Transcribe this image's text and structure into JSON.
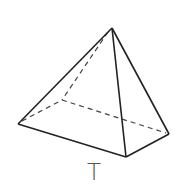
{
  "diagram": {
    "type": "pyramid",
    "label": "T",
    "colors": {
      "edge": "#222222",
      "label": "#555555",
      "background": "#ffffff"
    },
    "vertices": {
      "apex": [
        112,
        28
      ],
      "left": [
        18,
        124
      ],
      "front": [
        126,
        157
      ],
      "right": [
        169,
        134
      ],
      "back": [
        62,
        100
      ]
    },
    "visible_edges": [
      [
        "apex",
        "left"
      ],
      [
        "apex",
        "front"
      ],
      [
        "apex",
        "right"
      ],
      [
        "left",
        "front"
      ],
      [
        "front",
        "right"
      ]
    ],
    "hidden_edges": [
      [
        "apex",
        "back"
      ],
      [
        "left",
        "back"
      ],
      [
        "back",
        "right"
      ]
    ]
  }
}
